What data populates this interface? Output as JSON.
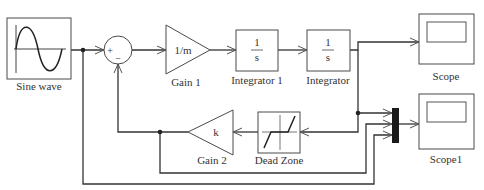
{
  "diagram": {
    "type": "simulink-block-diagram",
    "colors": {
      "line": "#333333",
      "block_border": "#4a4a4a",
      "mux_fill": "#1a1a1a",
      "background": "#ffffff"
    },
    "blocks": {
      "sine_wave": {
        "label": "Sine wave"
      },
      "sum": {
        "plus_sign": "+",
        "minus_sign": "−"
      },
      "gain1": {
        "label": "Gain 1",
        "value": "1/m"
      },
      "integrator1": {
        "label": "Integrator 1",
        "numerator": "1",
        "denominator": "s"
      },
      "integrator": {
        "label": "Integrator",
        "numerator": "1",
        "denominator": "s"
      },
      "scope": {
        "label": "Scope"
      },
      "mux": {
        "inputs": 3
      },
      "scope1": {
        "label": "Scope1"
      },
      "dead_zone": {
        "label": "Dead Zone"
      },
      "gain2": {
        "label": "Gain 2",
        "value": "k"
      }
    },
    "connections": [
      {
        "from": "Sine wave",
        "to": "Sum (+)"
      },
      {
        "from": "Sum",
        "to": "Gain 1"
      },
      {
        "from": "Gain 1",
        "to": "Integrator 1"
      },
      {
        "from": "Integrator 1",
        "to": "Integrator"
      },
      {
        "from": "Integrator",
        "to": "Scope"
      },
      {
        "from": "Integrator",
        "to": "Mux input 1"
      },
      {
        "from": "Integrator",
        "to": "Dead Zone"
      },
      {
        "from": "Dead Zone",
        "to": "Gain 2"
      },
      {
        "from": "Gain 2",
        "to": "Sum (−)"
      },
      {
        "from": "Gain 2",
        "to": "Mux input 2"
      },
      {
        "from": "Sine wave",
        "to": "Mux input 3"
      },
      {
        "from": "Mux",
        "to": "Scope1"
      }
    ]
  }
}
